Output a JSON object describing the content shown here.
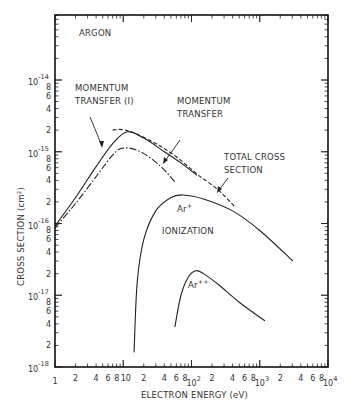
{
  "chart_data": {
    "type": "line",
    "title": "ARGON",
    "xlabel": "ELECTRON ENERGY (eV)",
    "ylabel": "CROSS SECTION (cm²)",
    "xscale": "log",
    "yscale": "log",
    "xlim": [
      1,
      10000
    ],
    "ylim": [
      1e-18,
      8e-14
    ],
    "grid": false,
    "x_ticks": [
      {
        "value": 1,
        "label": "1",
        "exp": ""
      },
      {
        "value": 10,
        "label": "10",
        "exp": ""
      },
      {
        "value": 100,
        "label": "10",
        "exp": "2"
      },
      {
        "value": 1000,
        "label": "10",
        "exp": "3"
      },
      {
        "value": 10000,
        "label": "10",
        "exp": "4"
      }
    ],
    "x_minor_labels": [
      "2",
      "4",
      "6",
      "8"
    ],
    "y_ticks": [
      {
        "value": 1e-18,
        "label": "10",
        "exp": "-18"
      },
      {
        "value": 1e-17,
        "label": "10",
        "exp": "-17"
      },
      {
        "value": 1e-16,
        "label": "10",
        "exp": "-16"
      },
      {
        "value": 1e-15,
        "label": "10",
        "exp": "-15"
      },
      {
        "value": 1e-14,
        "label": "10",
        "exp": "-14"
      }
    ],
    "y_minor_labels": [
      "2",
      "4",
      "6",
      "8"
    ],
    "series": [
      {
        "name": "Momentum transfer (I)",
        "style": "solid",
        "x": [
          1,
          2,
          4,
          7,
          11.4,
          20,
          40,
          70,
          120
        ],
        "y": [
          9.2e-17,
          2.3e-16,
          6.2e-16,
          1.3e-15,
          1.9e-15,
          1.55e-15,
          1e-15,
          7e-16,
          4.7e-16
        ]
      },
      {
        "name": "Total cross section",
        "style": "dashed",
        "x": [
          7,
          9,
          14,
          30,
          60,
          120,
          250,
          435
        ],
        "y": [
          2e-15,
          2.05e-15,
          1.85e-15,
          1.3e-15,
          8.5e-16,
          4.9e-16,
          2.9e-16,
          1.7e-16
        ]
      },
      {
        "name": "Momentum transfer",
        "style": "dash-dot",
        "x": [
          1,
          2,
          4,
          7,
          10,
          18,
          35,
          57
        ],
        "y": [
          8.7e-17,
          1.9e-16,
          4.5e-16,
          9e-16,
          1.13e-15,
          1e-15,
          6.3e-16,
          3.8e-16
        ]
      },
      {
        "name": "Ar+ ionization",
        "style": "solid",
        "x": [
          14.4,
          16,
          20,
          30,
          50,
          75,
          150,
          400,
          1000,
          3070
        ],
        "y": [
          1.6e-18,
          1.5e-17,
          6e-17,
          1.5e-16,
          2.3e-16,
          2.5e-16,
          2.2e-16,
          1.5e-16,
          8e-17,
          3e-17
        ]
      },
      {
        "name": "Ar++ ionization",
        "style": "solid",
        "x": [
          57,
          70,
          90,
          116,
          150,
          250,
          500,
          1190
        ],
        "y": [
          3.6e-18,
          1e-17,
          1.8e-17,
          2.2e-17,
          2e-17,
          1.4e-17,
          8e-18,
          4.4e-18
        ]
      }
    ],
    "annotations": [
      {
        "id": "argon",
        "text": "ARGON"
      },
      {
        "id": "mt1",
        "lines": [
          "MOMENTUM",
          "TRANSFER (I)"
        ],
        "points_to": "Momentum transfer (I)"
      },
      {
        "id": "mt",
        "lines": [
          "MOMENTUM",
          "TRANSFER"
        ],
        "points_to": "Momentum transfer"
      },
      {
        "id": "total",
        "lines": [
          "TOTAL CROSS",
          "SECTION"
        ],
        "points_to": "Total cross section"
      },
      {
        "id": "ionization",
        "text": "IONIZATION"
      },
      {
        "id": "arplus",
        "text": "Ar",
        "sup": "+"
      },
      {
        "id": "arplusplus",
        "text": "Ar",
        "sup": "++"
      }
    ]
  }
}
